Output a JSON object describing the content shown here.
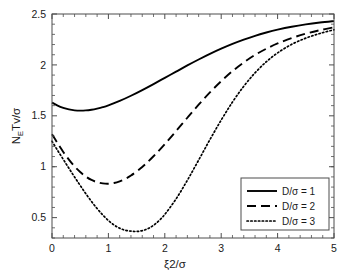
{
  "chart_data": {
    "type": "line",
    "title": "",
    "xlabel": "ξ2/σ",
    "ylabel_parts": {
      "n": "N",
      "e": "E",
      "rest": "Tv/σ"
    },
    "ylabel": "N_E Tv/σ",
    "xlim": [
      0,
      5
    ],
    "ylim": [
      0.3,
      2.5
    ],
    "xticks": [
      0,
      1,
      2,
      3,
      4,
      5
    ],
    "xtick_labels": [
      "0",
      "1",
      "2",
      "3",
      "4",
      "5"
    ],
    "yticks": [
      0.5,
      1,
      1.5,
      2,
      2.5
    ],
    "ytick_labels": [
      "0.5",
      "1",
      "1.5",
      "2",
      "2.5"
    ],
    "grid": false,
    "minor_ticks": true,
    "legend_position": "lower-right",
    "line_color": "#000000",
    "axis_color": "#4d4d4d",
    "series": [
      {
        "name": "D/σ = 1",
        "dash": "solid",
        "x": [
          0.0,
          0.1,
          0.2,
          0.3,
          0.4,
          0.5,
          0.6,
          0.7,
          0.8,
          0.9,
          1.0,
          1.2,
          1.4,
          1.6,
          1.8,
          2.0,
          2.2,
          2.4,
          2.6,
          2.8,
          3.0,
          3.2,
          3.4,
          3.6,
          3.8,
          4.0,
          4.25,
          4.5,
          4.75,
          5.0
        ],
        "values": [
          1.63,
          1.6,
          1.578,
          1.563,
          1.554,
          1.551,
          1.553,
          1.56,
          1.571,
          1.585,
          1.603,
          1.646,
          1.697,
          1.753,
          1.812,
          1.873,
          1.934,
          1.995,
          2.053,
          2.108,
          2.159,
          2.206,
          2.248,
          2.286,
          2.318,
          2.346,
          2.375,
          2.398,
          2.416,
          2.43
        ]
      },
      {
        "name": "D/σ = 2",
        "dash": "dashed",
        "x": [
          0.0,
          0.1,
          0.2,
          0.3,
          0.4,
          0.5,
          0.6,
          0.7,
          0.8,
          0.9,
          1.0,
          1.1,
          1.2,
          1.3,
          1.4,
          1.6,
          1.8,
          2.0,
          2.2,
          2.4,
          2.6,
          2.8,
          3.0,
          3.2,
          3.4,
          3.6,
          3.8,
          4.0,
          4.25,
          4.5,
          4.75,
          5.0
        ],
        "values": [
          1.32,
          1.23,
          1.145,
          1.07,
          1.003,
          0.948,
          0.903,
          0.87,
          0.848,
          0.836,
          0.833,
          0.84,
          0.856,
          0.881,
          0.913,
          0.998,
          1.103,
          1.222,
          1.35,
          1.481,
          1.609,
          1.73,
          1.84,
          1.939,
          2.024,
          2.098,
          2.159,
          2.211,
          2.264,
          2.307,
          2.341,
          2.37
        ]
      },
      {
        "name": "D/σ = 3",
        "dash": "dotted",
        "x": [
          0.0,
          0.1,
          0.2,
          0.3,
          0.4,
          0.5,
          0.6,
          0.7,
          0.8,
          0.9,
          1.0,
          1.1,
          1.2,
          1.3,
          1.4,
          1.5,
          1.6,
          1.7,
          1.8,
          1.9,
          2.0,
          2.2,
          2.4,
          2.6,
          2.8,
          3.0,
          3.2,
          3.4,
          3.6,
          3.8,
          4.0,
          4.25,
          4.5,
          4.75,
          5.0
        ],
        "values": [
          1.25,
          1.16,
          1.072,
          0.985,
          0.899,
          0.816,
          0.735,
          0.659,
          0.589,
          0.526,
          0.472,
          0.428,
          0.396,
          0.376,
          0.367,
          0.364,
          0.372,
          0.392,
          0.425,
          0.472,
          0.532,
          0.684,
          0.867,
          1.065,
          1.266,
          1.458,
          1.635,
          1.79,
          1.922,
          2.031,
          2.118,
          2.202,
          2.263,
          2.309,
          2.345
        ]
      }
    ]
  },
  "legend": {
    "items": [
      {
        "label": "D/σ = 1",
        "style": "solid"
      },
      {
        "label": "D/σ = 2",
        "style": "dashed"
      },
      {
        "label": "D/σ = 3",
        "style": "dotted"
      }
    ]
  }
}
